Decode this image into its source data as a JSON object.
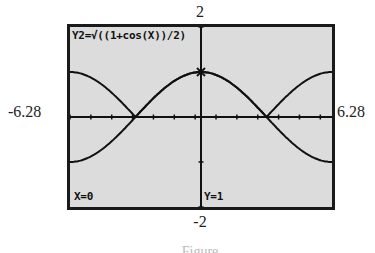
{
  "window": {
    "ymax_label": "2",
    "ymin_label": "-2",
    "xmin_label": "-6.28",
    "xmax_label": "6.28"
  },
  "screen": {
    "equation": "Y2=√((1+cos(X))/2)",
    "trace_x": "X=0",
    "trace_y": "Y=1"
  },
  "caption": "Figure",
  "chart_data": {
    "type": "line",
    "title": "Y2=√((1+cos(X))/2)",
    "xlabel": "",
    "ylabel": "",
    "xlim": [
      -6.28,
      6.28
    ],
    "ylim": [
      -2,
      2
    ],
    "grid": false,
    "series": [
      {
        "name": "Y2 = sqrt((1+cos X)/2)",
        "x": [
          -6.28,
          -4.71,
          -3.14,
          -1.57,
          0,
          1.57,
          3.14,
          4.71,
          6.28
        ],
        "values": [
          1,
          0.707,
          0,
          0.707,
          1,
          0.707,
          0,
          0.707,
          1
        ]
      },
      {
        "name": "y = cos(x/2)",
        "x": [
          -6.28,
          -4.71,
          -3.14,
          -1.57,
          0,
          1.57,
          3.14,
          4.71,
          6.28
        ],
        "values": [
          -1,
          -0.707,
          0,
          0.707,
          1,
          0.707,
          0,
          -0.707,
          -1
        ]
      }
    ],
    "annotations": [
      {
        "text": "X=0",
        "position": "bottom-left"
      },
      {
        "text": "Y=1",
        "position": "bottom-center"
      },
      {
        "text": "trace cursor",
        "x": 0,
        "y": 1
      }
    ],
    "x_ticks_spacing": 1.57,
    "y_ticks_spacing": 1
  }
}
